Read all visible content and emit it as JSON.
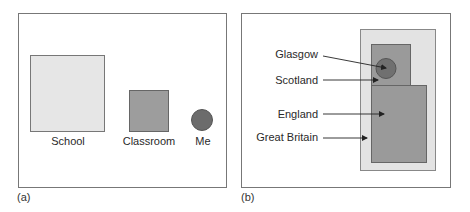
{
  "panel_a": {
    "caption": "(a)",
    "items": [
      {
        "label": "School",
        "shape": "square",
        "color": "#e6e6e6"
      },
      {
        "label": "Classroom",
        "shape": "square",
        "color": "#9d9d9d"
      },
      {
        "label": "Me",
        "shape": "circle",
        "color": "#6c6c6c"
      }
    ]
  },
  "panel_b": {
    "caption": "(b)",
    "labels": [
      {
        "label": "Glasgow",
        "shape": "circle",
        "color": "#707070"
      },
      {
        "label": "Scotland",
        "shape": "rect",
        "color": "#9a9a9a"
      },
      {
        "label": "England",
        "shape": "rect",
        "color": "#9a9a9a"
      },
      {
        "label": "Great Britain",
        "shape": "rect",
        "color": "#e3e3e3"
      }
    ]
  }
}
